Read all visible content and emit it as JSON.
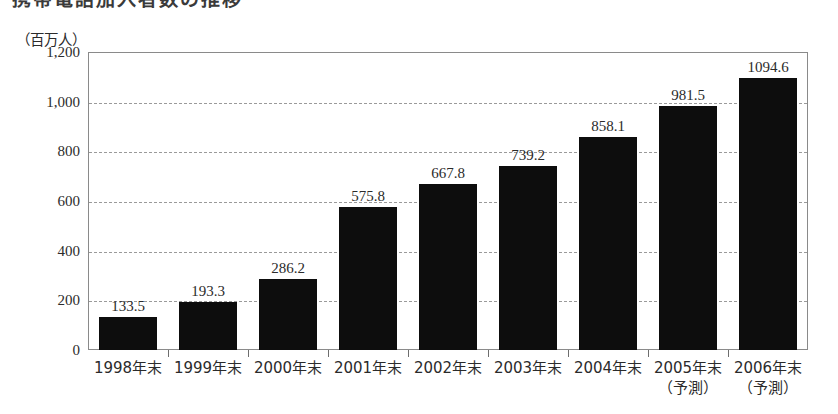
{
  "title_sliver": {
    "text": "携帯電話加入者数の推移"
  },
  "unit_caption": "（百万人）",
  "chart_data": {
    "type": "bar",
    "title": "携帯電話加入者数の推移",
    "xlabel": "",
    "ylabel": "（百万人）",
    "ylim": [
      0,
      1200
    ],
    "ytick_values": [
      0,
      200,
      400,
      600,
      800,
      1000,
      1200
    ],
    "ytick_labels": [
      "0",
      "200",
      "400",
      "600",
      "800",
      "1,000",
      "1,200"
    ],
    "grid": true,
    "grid_axis": "y",
    "legend": null,
    "bar_color": "#0d0d0d",
    "categories": [
      "1998年末",
      "1999年末",
      "2000年末",
      "2001年末",
      "2002年末",
      "2003年末",
      "2004年末",
      "2005年末",
      "2006年末"
    ],
    "category_sublabels": [
      "",
      "",
      "",
      "",
      "",
      "",
      "",
      "（予測）",
      "（予測）"
    ],
    "values": [
      133.5,
      193.3,
      286.2,
      575.8,
      667.8,
      739.2,
      858.1,
      981.5,
      1094.6
    ],
    "value_labels": [
      "133.5",
      "193.3",
      "286.2",
      "575.8",
      "667.8",
      "739.2",
      "858.1",
      "981.5",
      "1094.6"
    ]
  }
}
